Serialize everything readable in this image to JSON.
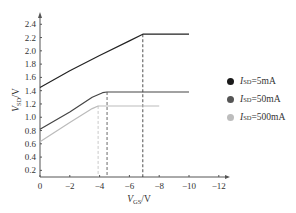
{
  "chart_data": {
    "type": "line",
    "title": "",
    "xlabel": "V_GS/V",
    "ylabel": "V_SD/V",
    "xlim": [
      0,
      -12
    ],
    "ylim": [
      0.1,
      2.5
    ],
    "x_ticks": [
      "0",
      "−2",
      "−4",
      "−6",
      "−8",
      "−10",
      "−12"
    ],
    "y_ticks": [
      "0.2",
      "0.4",
      "0.6",
      "0.8",
      "1.0",
      "1.2",
      "1.4",
      "1.6",
      "1.8",
      "2.0",
      "2.2",
      "2.4"
    ],
    "grid": false,
    "legend_position": "right",
    "series": [
      {
        "name": "I_SD=5mA",
        "color": "#222222",
        "x": [
          0,
          -2,
          -4,
          -6,
          -6.9,
          -10
        ],
        "y": [
          1.45,
          1.7,
          1.93,
          2.15,
          2.25,
          2.25
        ],
        "saturation_vgs": -6.9,
        "saturation_vsd": 2.25
      },
      {
        "name": "I_SD=50mA",
        "color": "#444444",
        "x": [
          0,
          -2,
          -3.5,
          -4.2,
          -4.5,
          -10
        ],
        "y": [
          0.82,
          1.08,
          1.3,
          1.37,
          1.38,
          1.38
        ],
        "saturation_vgs": -4.5,
        "saturation_vsd": 1.38
      },
      {
        "name": "I_SD=500mA",
        "color": "#bbbbbb",
        "x": [
          0,
          -2,
          -3.5,
          -3.9,
          -8
        ],
        "y": [
          0.63,
          0.92,
          1.13,
          1.17,
          1.17
        ],
        "saturation_vgs": -3.9,
        "saturation_vsd": 1.17
      }
    ]
  },
  "legend": [
    {
      "label_main": "I",
      "label_sub": "SD",
      "label_rest": "=5mA",
      "color": "#1a1a1a"
    },
    {
      "label_main": "I",
      "label_sub": "SD",
      "label_rest": "=50mA",
      "color": "#555555"
    },
    {
      "label_main": "I",
      "label_sub": "SD",
      "label_rest": "=500mA",
      "color": "#bdbdbd"
    }
  ],
  "axis_labels": {
    "x_main": "V",
    "x_sub": "GS",
    "x_rest": "/V",
    "y_main": "V",
    "y_sub": "SD",
    "y_rest": "/V"
  }
}
